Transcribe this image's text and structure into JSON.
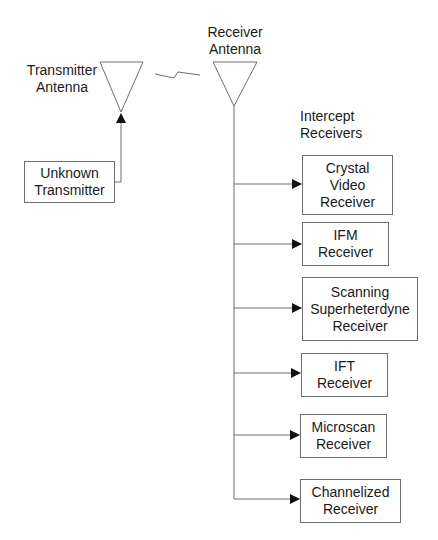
{
  "diagram": {
    "transmitter_antenna": {
      "line1": "Transmitter",
      "line2": "Antenna"
    },
    "receiver_antenna": {
      "line1": "Receiver",
      "line2": "Antenna"
    },
    "unknown_transmitter": {
      "line1": "Unknown",
      "line2": "Transmitter"
    },
    "intercept_header": {
      "line1": "Intercept",
      "line2": "Receivers"
    },
    "receivers": [
      {
        "line1": "Crystal",
        "line2": "Video",
        "line3": "Receiver"
      },
      {
        "line1": "IFM",
        "line2": "Receiver"
      },
      {
        "line1": "Scanning",
        "line2": "Superheterdyne",
        "line3": "Receiver"
      },
      {
        "line1": "IFT",
        "line2": "Receiver"
      },
      {
        "line1": "Microscan",
        "line2": "Receiver"
      },
      {
        "line1": "Channelized",
        "line2": "Receiver"
      }
    ]
  }
}
